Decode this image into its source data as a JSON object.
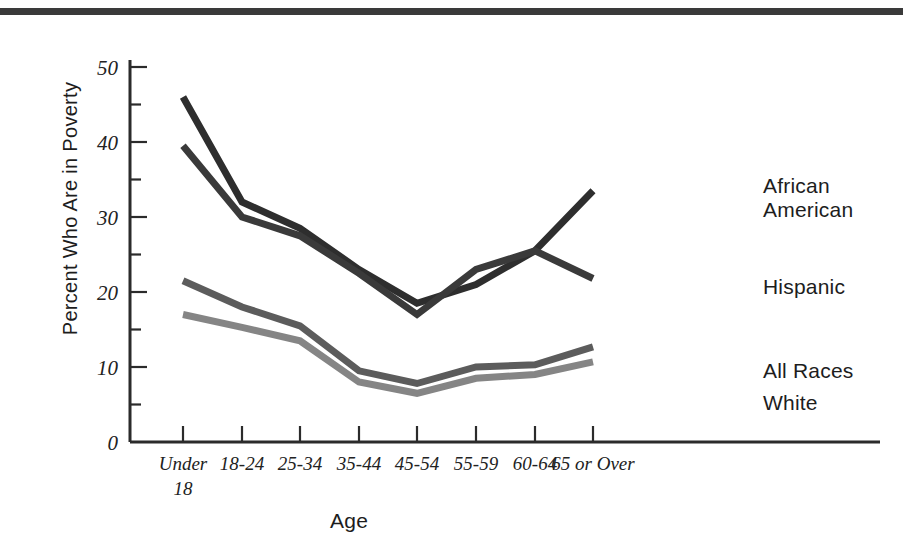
{
  "chart_data": {
    "type": "line",
    "title": "",
    "xlabel": "Age",
    "ylabel": "Percent Who Are in Poverty",
    "categories": [
      "Under 18",
      "18-24",
      "25-34",
      "35-44",
      "45-54",
      "55-59",
      "60-64",
      "65 or Over"
    ],
    "category_lines": [
      [
        "Under",
        "18"
      ],
      [
        "18-24"
      ],
      [
        "25-34"
      ],
      [
        "35-44"
      ],
      [
        "45-54"
      ],
      [
        "55-59"
      ],
      [
        "60-64"
      ],
      [
        "65 or Over"
      ]
    ],
    "ylim": [
      0,
      55
    ],
    "yticks": [
      0,
      10,
      20,
      30,
      40,
      50
    ],
    "ytick_labels": [
      "0",
      "10",
      "20",
      "30",
      "40",
      "50"
    ],
    "yticks_minor": [
      5,
      15,
      25,
      35,
      45
    ],
    "grid": false,
    "legend_position": "right-inline-labels",
    "series": [
      {
        "name": "African American",
        "color": "#2e2e2e",
        "values": [
          46.0,
          32.0,
          28.5,
          23.0,
          18.5,
          21.0,
          25.5,
          33.5
        ]
      },
      {
        "name": "Hispanic",
        "color": "#3a3a3a",
        "values": [
          39.5,
          30.0,
          27.5,
          22.5,
          17.0,
          23.0,
          25.5,
          21.8
        ]
      },
      {
        "name": "All Races",
        "color": "#5c5c5c",
        "values": [
          21.5,
          18.0,
          15.5,
          9.5,
          7.8,
          10.0,
          10.3,
          12.7
        ]
      },
      {
        "name": "White",
        "color": "#858585",
        "values": [
          17.0,
          15.3,
          13.5,
          8.0,
          6.5,
          8.5,
          9.0,
          10.7
        ]
      }
    ]
  },
  "legend": {
    "african_american": "African\nAmerican",
    "hispanic": "Hispanic",
    "all_races": "All Races",
    "white": "White"
  },
  "axes": {
    "y_title": "Percent Who Are in Poverty",
    "x_title": "Age"
  },
  "colors": {
    "top_rule": "#3a3a3a",
    "axis": "#2b2b2b",
    "background": "#ffffff",
    "african_american": "#2e2e2e",
    "hispanic": "#3a3a3a",
    "all_races": "#5c5c5c",
    "white": "#858585"
  }
}
